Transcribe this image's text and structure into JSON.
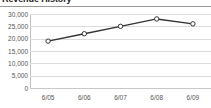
{
  "chart_data": {
    "type": "line",
    "title": "Revenue History",
    "xlabel": "",
    "ylabel": "",
    "categories": [
      "6/05",
      "6/06",
      "6/07",
      "6/08",
      "6/09"
    ],
    "series": [
      {
        "name": "Revenue",
        "values": [
          19000,
          22000,
          25000,
          28000,
          26000
        ]
      }
    ],
    "ylim": [
      0,
      30000
    ],
    "yticks": [
      0,
      5000,
      10000,
      15000,
      20000,
      25000,
      30000
    ],
    "ytick_labels": [
      "0",
      "5,000",
      "10,000",
      "15,000",
      "20,000",
      "25,000",
      "30,000"
    ],
    "grid": true,
    "legend": false,
    "marker": "open-circle",
    "colors": {
      "line": "#333333",
      "marker_fill": "#ffffff",
      "marker_stroke": "#333333",
      "grid": "#dcdcdc",
      "axis": "#c2c2c2",
      "tick_text": "#555555",
      "title_text": "#222222",
      "background": "#ffffff"
    }
  }
}
